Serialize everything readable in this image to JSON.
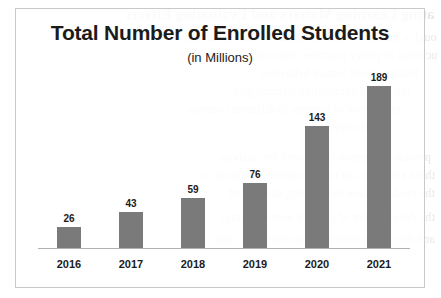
{
  "chart_data": {
    "type": "bar",
    "title": "Total Number of Enrolled Students",
    "subtitle": "(in Millions)",
    "xlabel": "",
    "ylabel": "",
    "categories": [
      "2016",
      "2017",
      "2018",
      "2019",
      "2020",
      "2021"
    ],
    "values": [
      26,
      43,
      59,
      76,
      143,
      189
    ],
    "labels": [
      "26",
      "43",
      "59",
      "76",
      "143",
      "189"
    ],
    "ylim": [
      0,
      189
    ],
    "grid": false,
    "legend": false,
    "bar_color": "#7a7a7a",
    "text_color": "#1b1b1b",
    "frame_color": "#c9c9c9",
    "axis_color": "#b0b0b0"
  },
  "background_bleed": {
    "lines": [
      "ating Learning Matters and Evaluating Effects",
      "ough a number of lenses, educators and researchers",
      "uctional or policy practices, innovation, scale, and",
      "hinking about human behaviour",
      "the role of appropriate technologies",
      "experience of learners in different contexts",
      "of inquiry",
      "provide a common framework for analysis",
      "these elements can be considered in relation to",
      "the evidence base for learning design and",
      "the development of practice across settings",
      "and the measurement of outcomes over time"
    ]
  }
}
